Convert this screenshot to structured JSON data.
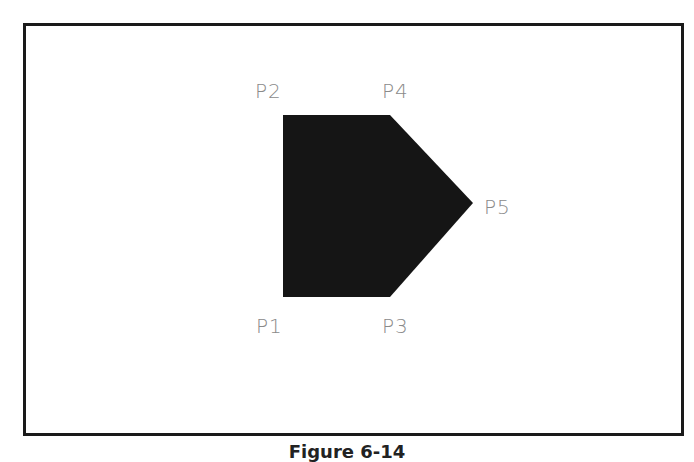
{
  "figure": {
    "caption": "Figure 6-14",
    "frame_color": "#1a1a1a",
    "polygon": {
      "fill": "#151515",
      "vertices_order": [
        "P1",
        "P2",
        "P4",
        "P5",
        "P3"
      ]
    },
    "points": [
      {
        "id": "P1",
        "label": "P1",
        "x": 283,
        "y": 297,
        "label_x": 256,
        "label_y": 316
      },
      {
        "id": "P2",
        "label": "P2",
        "x": 283,
        "y": 115,
        "label_x": 255,
        "label_y": 81
      },
      {
        "id": "P3",
        "label": "P3",
        "x": 390,
        "y": 297,
        "label_x": 382,
        "label_y": 316
      },
      {
        "id": "P4",
        "label": "P4",
        "x": 390,
        "y": 115,
        "label_x": 382,
        "label_y": 81
      },
      {
        "id": "P5",
        "label": "P5",
        "x": 473,
        "y": 203,
        "label_x": 484,
        "label_y": 197
      }
    ],
    "label_color": "#8a8a8a"
  }
}
